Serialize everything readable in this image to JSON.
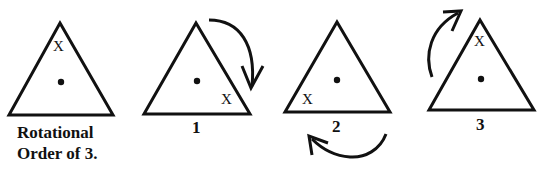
{
  "diagram": {
    "caption_line1": "Rotational",
    "caption_line2": "Order of 3.",
    "marker": "X",
    "triangles": [
      {
        "id": "original",
        "label": "",
        "marker_position": "top"
      },
      {
        "id": "1",
        "label": "1",
        "marker_position": "bottom-right",
        "arrow": "clockwise, right side"
      },
      {
        "id": "2",
        "label": "2",
        "marker_position": "bottom-left",
        "arrow": "clockwise, below"
      },
      {
        "id": "3",
        "label": "3",
        "marker_position": "top",
        "arrow": "clockwise, left side"
      }
    ],
    "stroke_color": "#111111",
    "background": "#ffffff"
  }
}
